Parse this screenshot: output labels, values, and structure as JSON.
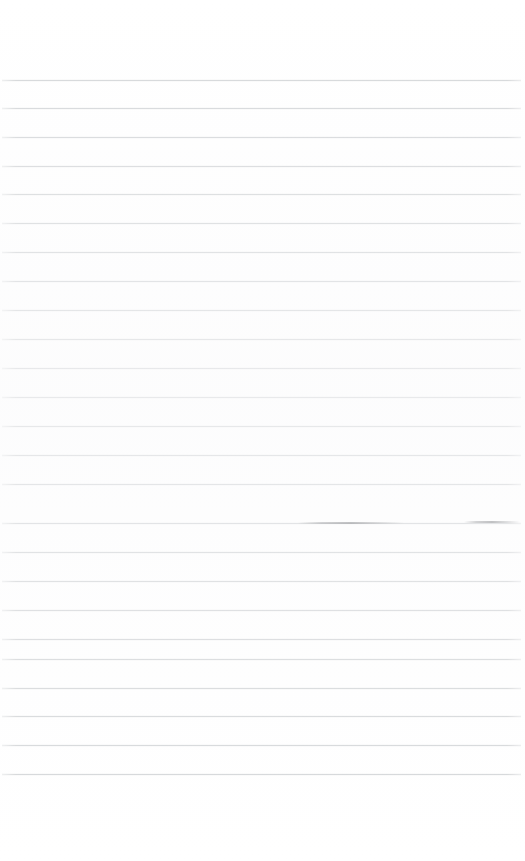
{
  "page": {
    "kind": "scanned-lined-paper",
    "width": 525,
    "height": 861,
    "background_color": "#ffffff",
    "body_text": "",
    "title_text": "",
    "has_visible_text": false
  },
  "ruling": {
    "line_color": "#d4d6d8",
    "line_thickness_px": 1,
    "line_spacing_px": 29,
    "line_count": 25,
    "first_line_y": 80,
    "last_line_y": 774,
    "line_left_x": 2,
    "line_right_x": 521,
    "top_margin_px": 80,
    "bottom_margin_px": 87,
    "lines": [
      {
        "index": 1,
        "y": 80,
        "x1": 2,
        "x2": 521
      },
      {
        "index": 2,
        "y": 108,
        "x1": 2,
        "x2": 521
      },
      {
        "index": 3,
        "y": 137,
        "x1": 2,
        "x2": 521
      },
      {
        "index": 4,
        "y": 166,
        "x1": 2,
        "x2": 521
      },
      {
        "index": 5,
        "y": 194,
        "x1": 2,
        "x2": 521
      },
      {
        "index": 6,
        "y": 223,
        "x1": 2,
        "x2": 521
      },
      {
        "index": 7,
        "y": 252,
        "x1": 2,
        "x2": 521
      },
      {
        "index": 8,
        "y": 281,
        "x1": 2,
        "x2": 521
      },
      {
        "index": 9,
        "y": 310,
        "x1": 2,
        "x2": 521
      },
      {
        "index": 10,
        "y": 339,
        "x1": 2,
        "x2": 521
      },
      {
        "index": 11,
        "y": 368,
        "x1": 2,
        "x2": 521
      },
      {
        "index": 12,
        "y": 397,
        "x1": 2,
        "x2": 521
      },
      {
        "index": 13,
        "y": 426,
        "x1": 2,
        "x2": 521
      },
      {
        "index": 14,
        "y": 455,
        "x1": 2,
        "x2": 521
      },
      {
        "index": 15,
        "y": 484,
        "x1": 2,
        "x2": 521
      },
      {
        "index": 16,
        "y": 523,
        "x1": 2,
        "x2": 521
      },
      {
        "index": 17,
        "y": 552,
        "x1": 2,
        "x2": 521
      },
      {
        "index": 18,
        "y": 581,
        "x1": 2,
        "x2": 521
      },
      {
        "index": 19,
        "y": 610,
        "x1": 2,
        "x2": 521
      },
      {
        "index": 20,
        "y": 639,
        "x1": 2,
        "x2": 521
      },
      {
        "index": 21,
        "y": 659,
        "x1": 2,
        "x2": 521
      },
      {
        "index": 22,
        "y": 688,
        "x1": 2,
        "x2": 521
      },
      {
        "index": 23,
        "y": 716,
        "x1": 2,
        "x2": 521
      },
      {
        "index": 24,
        "y": 745,
        "x1": 2,
        "x2": 521
      },
      {
        "index": 25,
        "y": 774,
        "x1": 2,
        "x2": 521
      }
    ]
  },
  "marks": [
    {
      "name": "pencil-stroke-center",
      "y": 522,
      "x1": 298,
      "x2": 404,
      "color": "#7b7d81",
      "note": "faint darker stroke overlapping rule 16"
    },
    {
      "name": "pencil-stroke-right",
      "y": 521,
      "x1": 464,
      "x2": 520,
      "color": "#8a8c90",
      "note": "short faint stroke at right edge on rule 16"
    }
  ]
}
